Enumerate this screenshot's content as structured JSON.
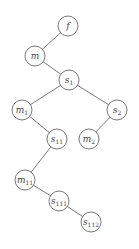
{
  "diagram": {
    "type": "tree",
    "colors": {
      "stroke": "#6a6a6a",
      "text": "#444444",
      "background": "#ffffff"
    },
    "node_radius": 10,
    "nodes": [
      {
        "id": "f",
        "base": "f",
        "sub": "",
        "x": 68,
        "y": 26
      },
      {
        "id": "m",
        "base": "m",
        "sub": "",
        "x": 35,
        "y": 56
      },
      {
        "id": "s1",
        "base": "s",
        "sub": "1",
        "x": 69,
        "y": 80
      },
      {
        "id": "m1",
        "base": "m",
        "sub": "1",
        "x": 22,
        "y": 110
      },
      {
        "id": "s2",
        "base": "s",
        "sub": "2",
        "x": 117,
        "y": 110
      },
      {
        "id": "s11",
        "base": "s",
        "sub": "11",
        "x": 57,
        "y": 139
      },
      {
        "id": "m2",
        "base": "m",
        "sub": "2",
        "x": 89,
        "y": 139
      },
      {
        "id": "m11",
        "base": "m",
        "sub": "11",
        "x": 25,
        "y": 180
      },
      {
        "id": "s111",
        "base": "s",
        "sub": "111",
        "x": 59,
        "y": 201
      },
      {
        "id": "s112",
        "base": "s",
        "sub": "112",
        "x": 91,
        "y": 222
      }
    ],
    "edges": [
      [
        "f",
        "m"
      ],
      [
        "m",
        "s1"
      ],
      [
        "s1",
        "m1"
      ],
      [
        "s1",
        "s2"
      ],
      [
        "m1",
        "s11"
      ],
      [
        "s2",
        "m2"
      ],
      [
        "s11",
        "m11"
      ],
      [
        "m11",
        "s111"
      ],
      [
        "s111",
        "s112"
      ]
    ]
  }
}
